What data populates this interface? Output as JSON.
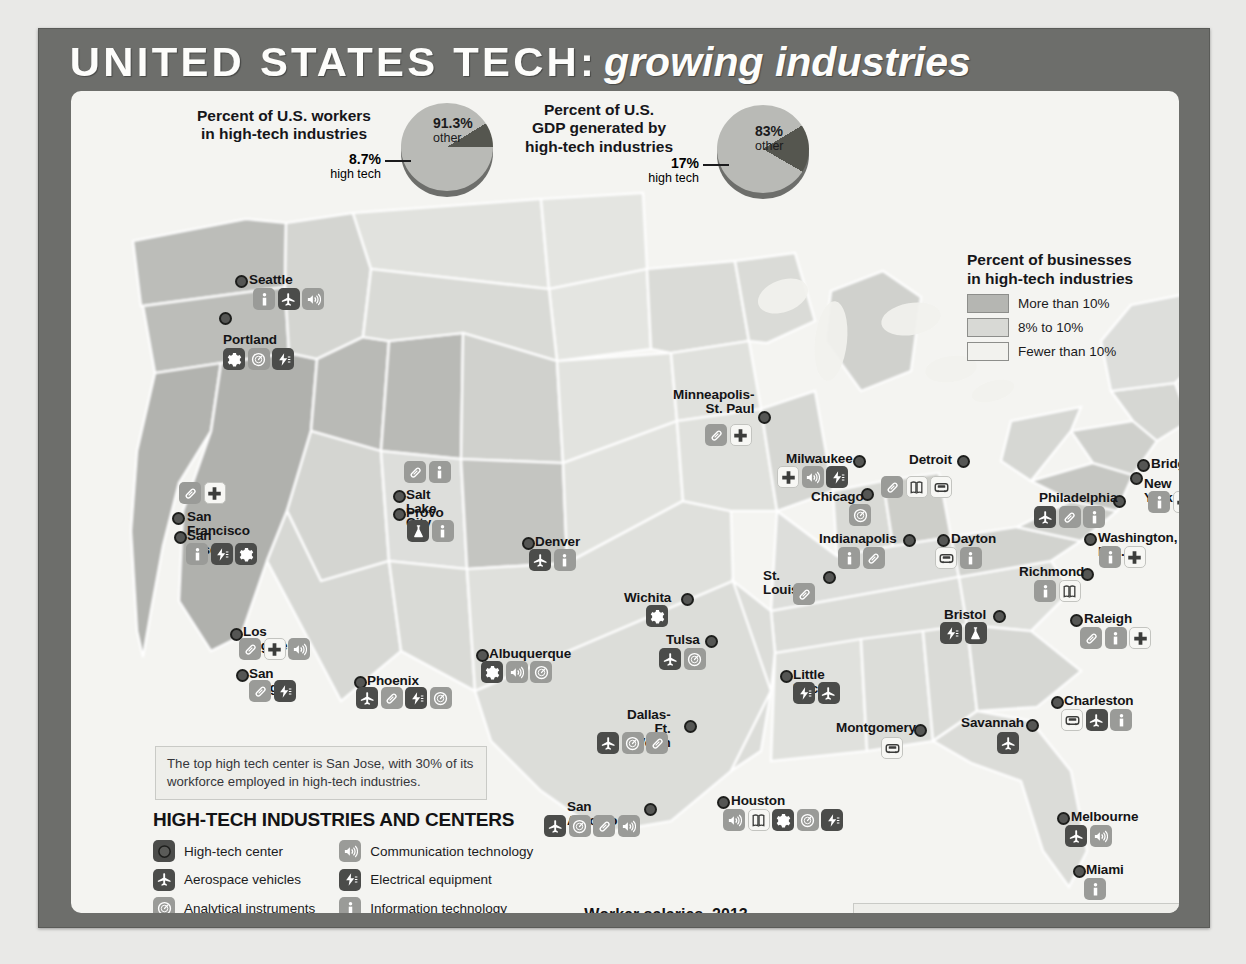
{
  "title": {
    "main": "UNITED STATES TECH:",
    "sub": "growing industries"
  },
  "pies": [
    {
      "name": "workers-pie",
      "title": "Percent of U.S. workers\nin high-tech industries",
      "major_value": "91.3%",
      "major_label": "other",
      "minor_value": "8.7%",
      "minor_label": "high tech",
      "minor_pct": 8.7,
      "major_pct": 91.3
    },
    {
      "name": "gdp-pie",
      "title": "Percent of U.S.\nGDP generated by\nhigh-tech industries",
      "major_value": "83%",
      "major_label": "other",
      "minor_value": "17%",
      "minor_label": "high tech",
      "minor_pct": 17,
      "major_pct": 83
    }
  ],
  "choropleth": {
    "title": "Percent of businesses\nin high-tech industries",
    "classes": [
      {
        "label": "More than 10%",
        "color": "#b5b6b2"
      },
      {
        "label": "8% to 10%",
        "color": "#d8d9d5"
      },
      {
        "label": "Fewer than 10%",
        "color": "#f2f2ee"
      }
    ]
  },
  "legend": {
    "heading": "HIGH-TECH INDUSTRIES AND CENTERS",
    "col1": [
      {
        "icon": "high-tech-center-icon",
        "label": "High-tech center"
      },
      {
        "icon": "aerospace-icon",
        "label": "Aerospace vehicles"
      },
      {
        "icon": "analytical-instruments-icon",
        "label": "Analytical instruments"
      },
      {
        "icon": "automotive-icon",
        "label": "Automotive"
      },
      {
        "icon": "biopharmaceuticals-icon",
        "label": "Biopharmaceuticals"
      },
      {
        "icon": "chemicals-icon",
        "label": "Chemicals"
      }
    ],
    "col2": [
      {
        "icon": "communication-icon",
        "label": "Communication technology"
      },
      {
        "icon": "electrical-icon",
        "label": "Electrical equipment"
      },
      {
        "icon": "information-tech-icon",
        "label": "Information technology"
      },
      {
        "icon": "medical-icon",
        "label": "Medical technology"
      },
      {
        "icon": "metal-manufacturing-icon",
        "label": "Metal manufacturing"
      },
      {
        "icon": "plastics-icon",
        "label": "Plastics"
      }
    ]
  },
  "callouts": {
    "san_jose": "The top high tech center is San Jose, with 30% of its workforce employed in high-tech industries.",
    "footnote": "High-tech industries employ 80% of U.S. engineers, generate 85% of patents, 60% of exports, and the vast majority of R & D.  Almost a quarter of all American jobs are directly or indirectly supported by high tech industries."
  },
  "chart_data": {
    "type": "bar",
    "title": "Worker salaries, 2013",
    "categories": [
      "U.S. average",
      "High tech worker"
    ],
    "values": [
      50130,
      89300
    ],
    "value_labels": [
      "$50,130",
      "$89,300"
    ],
    "xlabel": "",
    "ylabel": "",
    "xlim": [
      0,
      100000
    ],
    "grid": false,
    "orientation": "horizontal"
  },
  "cities": [
    {
      "name": "Seattle",
      "label": "Seattle",
      "x": 178,
      "y": 182,
      "dotx": 164,
      "doty": 184,
      "labelAlign": "left",
      "icons": [
        "information-tech",
        "aerospace",
        "communication"
      ],
      "iconx": 182,
      "icony": 197
    },
    {
      "name": "Portland",
      "label": "Portland",
      "x": 152,
      "y": 242,
      "dotx": 148,
      "doty": 221,
      "labelAlign": "left",
      "icons": [
        "metal-manufacturing",
        "analytical-instruments",
        "electrical"
      ],
      "iconx": 152,
      "icony": 257
    },
    {
      "name": "San Francisco",
      "label": "San Francisco",
      "x": 116,
      "y": 419,
      "dotx": 101,
      "doty": 421,
      "labelAlign": "left",
      "icons": [
        "biopharmaceuticals",
        "medical"
      ],
      "iconx": 108,
      "icony": 391
    },
    {
      "name": "San Jose",
      "label": "San Jose",
      "x": 116,
      "y": 438,
      "dotx": 103,
      "doty": 440,
      "labelAlign": "left",
      "icons": [
        "information-tech",
        "electrical",
        "metal-manufacturing"
      ],
      "iconx": 115,
      "icony": 452
    },
    {
      "name": "Los Angeles",
      "label": "Los Angeles",
      "x": 172,
      "y": 534,
      "dotx": 159,
      "doty": 537,
      "labelAlign": "left",
      "icons": [
        "biopharmaceuticals",
        "medical",
        "communication"
      ],
      "iconx": 168,
      "icony": 547
    },
    {
      "name": "San Diego",
      "label": "San Diego",
      "x": 178,
      "y": 576,
      "dotx": 165,
      "doty": 578,
      "labelAlign": "left",
      "icons": [
        "biopharmaceuticals",
        "electrical"
      ],
      "iconx": 178,
      "icony": 589
    },
    {
      "name": "Phoenix",
      "label": "Phoenix",
      "x": 296,
      "y": 583,
      "dotx": 283,
      "doty": 585,
      "labelAlign": "left",
      "icons": [
        "aerospace",
        "biopharmaceuticals",
        "electrical",
        "analytical-instruments"
      ],
      "iconx": 285,
      "icony": 596
    },
    {
      "name": "Salt Lake City",
      "label": "Salt Lake City",
      "x": 335,
      "y": 397,
      "dotx": 322,
      "doty": 399,
      "labelAlign": "left",
      "icons": [
        "biopharmaceuticals",
        "information-tech"
      ],
      "iconx": 333,
      "icony": 370
    },
    {
      "name": "Provo",
      "label": "Provo",
      "x": 335,
      "y": 415,
      "dotx": 322,
      "doty": 417,
      "labelAlign": "left",
      "icons": [
        "chemicals",
        "information-tech"
      ],
      "iconx": 336,
      "icony": 429
    },
    {
      "name": "Denver",
      "label": "Denver",
      "x": 464,
      "y": 444,
      "dotx": 451,
      "doty": 446,
      "labelAlign": "left",
      "icons": [
        "aerospace",
        "information-tech"
      ],
      "iconx": 458,
      "icony": 458
    },
    {
      "name": "Albuquerque",
      "label": "Albuquerque",
      "x": 418,
      "y": 556,
      "dotx": 405,
      "doty": 558,
      "labelAlign": "left",
      "icons": [
        "metal-manufacturing",
        "communication",
        "analytical-instruments"
      ],
      "iconx": 410,
      "icony": 570
    },
    {
      "name": "Wichita",
      "label": "Wichita",
      "x": 553,
      "y": 500,
      "dotx": 610,
      "doty": 502,
      "labelAlign": "left",
      "icons": [
        "metal-manufacturing"
      ],
      "iconx": 575,
      "icony": 514
    },
    {
      "name": "Tulsa",
      "label": "Tulsa",
      "x": 595,
      "y": 542,
      "dotx": 634,
      "doty": 544,
      "labelAlign": "left",
      "icons": [
        "aerospace",
        "analytical-instruments"
      ],
      "iconx": 588,
      "icony": 557
    },
    {
      "name": "Dallas-Ft. Worth",
      "label": "Dallas-\nFt. Worth",
      "x": 556,
      "y": 617,
      "dotx": 613,
      "doty": 629,
      "labelAlign": "left",
      "icons": [
        "aerospace",
        "analytical-instruments",
        "biopharmaceuticals"
      ],
      "iconx": 526,
      "icony": 641
    },
    {
      "name": "San Antonio",
      "label": "San Antonio",
      "x": 496,
      "y": 709,
      "dotx": 573,
      "doty": 712,
      "labelAlign": "left",
      "icons": [
        "aerospace",
        "analytical-instruments",
        "biopharmaceuticals",
        "communication"
      ],
      "iconx": 473,
      "icony": 724
    },
    {
      "name": "Houston",
      "label": "Houston",
      "x": 660,
      "y": 703,
      "dotx": 646,
      "doty": 705,
      "labelAlign": "left",
      "icons": [
        "communication",
        "plastics",
        "metal-manufacturing",
        "analytical-instruments",
        "electrical"
      ],
      "iconx": 652,
      "icony": 718
    },
    {
      "name": "Little Rock",
      "label": "Little Rock",
      "x": 722,
      "y": 577,
      "dotx": 709,
      "doty": 579,
      "labelAlign": "left",
      "icons": [
        "electrical",
        "aerospace"
      ],
      "iconx": 722,
      "icony": 591
    },
    {
      "name": "Minneapolis-St. Paul",
      "label": "Minneapolis-\nSt. Paul",
      "x": 602,
      "y": 297,
      "dotx": 687,
      "doty": 320,
      "labelAlign": "left",
      "icons": [
        "biopharmaceuticals",
        "medical"
      ],
      "iconx": 634,
      "icony": 333
    },
    {
      "name": "Milwaukee",
      "label": "Milwaukee",
      "x": 715,
      "y": 361,
      "dotx": 782,
      "doty": 364,
      "labelAlign": "left",
      "icons": [
        "medical",
        "communication",
        "electrical"
      ],
      "iconx": 706,
      "icony": 375
    },
    {
      "name": "Chicago",
      "label": "Chicago",
      "x": 740,
      "y": 399,
      "dotx": 790,
      "doty": 397,
      "labelAlign": "left",
      "icons": [
        "analytical-instruments"
      ],
      "iconx": 778,
      "icony": 413
    },
    {
      "name": "Indianapolis",
      "label": "Indianapolis",
      "x": 748,
      "y": 441,
      "dotx": 832,
      "doty": 443,
      "labelAlign": "left",
      "icons": [
        "information-tech",
        "biopharmaceuticals"
      ],
      "iconx": 767,
      "icony": 456
    },
    {
      "name": "St. Louis",
      "label": "St. Louis",
      "x": 692,
      "y": 478,
      "dotx": 752,
      "doty": 480,
      "labelAlign": "left",
      "icons": [
        "biopharmaceuticals"
      ],
      "iconx": 722,
      "icony": 492
    },
    {
      "name": "Detroit",
      "label": "Detroit",
      "x": 838,
      "y": 362,
      "dotx": 886,
      "doty": 364,
      "labelAlign": "left",
      "icons": [
        "biopharmaceuticals",
        "plastics",
        "automotive"
      ],
      "iconx": 810,
      "icony": 385
    },
    {
      "name": "Dayton",
      "label": "Dayton",
      "x": 880,
      "y": 441,
      "dotx": 866,
      "doty": 443,
      "labelAlign": "left",
      "icons": [
        "automotive",
        "information-tech"
      ],
      "iconx": 864,
      "icony": 456
    },
    {
      "name": "Boston",
      "label": "Boston",
      "x": 1122,
      "y": 327,
      "dotx": 1108,
      "doty": 329,
      "labelAlign": "left",
      "icons": [
        "information-tech"
      ],
      "iconx": 1121,
      "icony": 342
    },
    {
      "name": "Bridgeport",
      "label": "Bridgeport",
      "x": 1080,
      "y": 366,
      "dotx": 1066,
      "doty": 368,
      "labelAlign": "left",
      "icons": [
        "aerospace",
        "metal-manufacturing"
      ],
      "iconx": 1153,
      "icony": 364
    },
    {
      "name": "New York",
      "label": "New York",
      "x": 1073,
      "y": 386,
      "dotx": 1059,
      "doty": 381,
      "labelAlign": "left",
      "icons": [
        "information-tech",
        "medical"
      ],
      "iconx": 1077,
      "icony": 400
    },
    {
      "name": "Philadelphia",
      "label": "Philadelphia",
      "x": 968,
      "y": 400,
      "dotx": 1042,
      "doty": 404,
      "labelAlign": "left",
      "icons": [
        "aerospace",
        "biopharmaceuticals",
        "information-tech"
      ],
      "iconx": 963,
      "icony": 415
    },
    {
      "name": "Washington, D.C.",
      "label": "Washington, D.C.",
      "x": 1027,
      "y": 440,
      "dotx": 1013,
      "doty": 442,
      "labelAlign": "left",
      "icons": [
        "information-tech",
        "medical"
      ],
      "iconx": 1028,
      "icony": 455
    },
    {
      "name": "Richmond",
      "label": "Richmond",
      "x": 948,
      "y": 474,
      "dotx": 1010,
      "doty": 477,
      "labelAlign": "left",
      "icons": [
        "information-tech",
        "plastics"
      ],
      "iconx": 963,
      "icony": 489
    },
    {
      "name": "Bristol",
      "label": "Bristol",
      "x": 873,
      "y": 517,
      "dotx": 922,
      "doty": 519,
      "labelAlign": "left",
      "icons": [
        "electrical",
        "chemicals"
      ],
      "iconx": 869,
      "icony": 531
    },
    {
      "name": "Raleigh",
      "label": "Raleigh",
      "x": 1013,
      "y": 521,
      "dotx": 999,
      "doty": 523,
      "labelAlign": "left",
      "icons": [
        "biopharmaceuticals",
        "information-tech",
        "medical"
      ],
      "iconx": 1009,
      "icony": 536
    },
    {
      "name": "Charleston",
      "label": "Charleston",
      "x": 993,
      "y": 603,
      "dotx": 980,
      "doty": 605,
      "labelAlign": "left",
      "icons": [
        "automotive",
        "aerospace",
        "information-tech"
      ],
      "iconx": 990,
      "icony": 618
    },
    {
      "name": "Savannah",
      "label": "Savannah",
      "x": 890,
      "y": 625,
      "dotx": 955,
      "doty": 628,
      "labelAlign": "left",
      "icons": [
        "aerospace"
      ],
      "iconx": 926,
      "icony": 641
    },
    {
      "name": "Montgomery",
      "label": "Montgomery",
      "x": 765,
      "y": 630,
      "dotx": 843,
      "doty": 633,
      "labelAlign": "left",
      "icons": [
        "automotive"
      ],
      "iconx": 810,
      "icony": 646
    },
    {
      "name": "Melbourne",
      "label": "Melbourne",
      "x": 1000,
      "y": 719,
      "dotx": 986,
      "doty": 721,
      "labelAlign": "left",
      "icons": [
        "aerospace",
        "communication"
      ],
      "iconx": 994,
      "icony": 734
    },
    {
      "name": "Miami",
      "label": "Miami",
      "x": 1015,
      "y": 772,
      "dotx": 1002,
      "doty": 774,
      "labelAlign": "left",
      "icons": [
        "information-tech"
      ],
      "iconx": 1013,
      "icony": 787
    }
  ],
  "icon_tones": {
    "high-tech-center": "dark",
    "aerospace": "dark",
    "analytical-instruments": "mid",
    "automotive": "white",
    "biopharmaceuticals": "mid",
    "chemicals": "dark",
    "communication": "mid",
    "electrical": "dark",
    "information-tech": "mid",
    "medical": "white",
    "metal-manufacturing": "dark",
    "plastics": "white"
  }
}
